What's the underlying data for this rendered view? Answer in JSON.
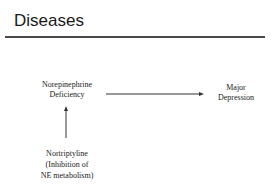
{
  "slide": {
    "title": "Diseases"
  },
  "diagram": {
    "nodes": {
      "norepinephrine_deficiency": {
        "lines": [
          "Norepinephrine",
          "Deficiency"
        ]
      },
      "major_depression": {
        "lines": [
          "Major",
          "Depression"
        ]
      },
      "nortriptyline": {
        "lines": [
          "Nortriptyline",
          "(Inhibition of",
          "NE metabolism)"
        ]
      }
    },
    "edges": [
      {
        "from": "norepinephrine_deficiency",
        "to": "major_depression",
        "direction": "right"
      },
      {
        "from": "nortriptyline",
        "to": "norepinephrine_deficiency",
        "direction": "up"
      }
    ],
    "colors": {
      "text": "#222222",
      "title": "#1a1a1a",
      "rule": "#4a4a4a",
      "arrow": "#333333",
      "background": "#ffffff"
    }
  }
}
